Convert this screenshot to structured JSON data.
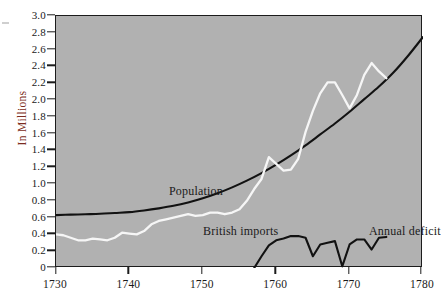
{
  "chart_data": {
    "type": "line",
    "title": "",
    "xlabel": "",
    "ylabel": "In Millions",
    "xlim": [
      1730,
      1780
    ],
    "ylim": [
      0,
      3.0
    ],
    "grid": false,
    "legend_position": "inline-annotations",
    "x_ticks": [
      1730,
      1740,
      1750,
      1760,
      1770,
      1780
    ],
    "x_tick_labels": [
      "1730",
      "1740",
      "1750",
      "1760",
      "1770",
      "1780"
    ],
    "y_ticks": [
      0,
      0.2,
      0.4,
      0.6,
      0.8,
      1.0,
      1.2,
      1.4,
      1.6,
      1.8,
      2.0,
      2.2,
      2.4,
      2.6,
      2.8,
      3.0
    ],
    "y_tick_labels": [
      "0",
      "0.2",
      "0.4",
      "0.6",
      "0.8",
      "1.0",
      "1.2",
      "1.4",
      "1.6",
      "1.8",
      "2.0",
      "2.2",
      "2.4",
      "2.6",
      "2.8",
      "3.0"
    ],
    "series": [
      {
        "name": "Population",
        "color": "#121212",
        "style": "smooth-solid",
        "annotation": "Population",
        "x": [
          1730,
          1732,
          1734,
          1736,
          1738,
          1740,
          1742,
          1744,
          1746,
          1748,
          1750,
          1752,
          1754,
          1756,
          1758,
          1760,
          1762,
          1764,
          1766,
          1768,
          1770,
          1772,
          1774,
          1776,
          1778,
          1780
        ],
        "values": [
          0.63,
          0.635,
          0.64,
          0.645,
          0.655,
          0.665,
          0.685,
          0.71,
          0.74,
          0.78,
          0.83,
          0.89,
          0.96,
          1.04,
          1.13,
          1.23,
          1.34,
          1.46,
          1.59,
          1.72,
          1.86,
          2.01,
          2.16,
          2.33,
          2.53,
          2.75
        ]
      },
      {
        "name": "British imports",
        "color": "#f6f6f6",
        "style": "jagged-solid",
        "annotation": "British imports",
        "x": [
          1730,
          1731,
          1732,
          1733,
          1734,
          1735,
          1736,
          1737,
          1738,
          1739,
          1740,
          1741,
          1742,
          1743,
          1744,
          1745,
          1746,
          1747,
          1748,
          1749,
          1750,
          1751,
          1752,
          1753,
          1754,
          1755,
          1756,
          1757,
          1758,
          1759,
          1760,
          1761,
          1762,
          1763,
          1764,
          1765,
          1766,
          1767,
          1768,
          1769,
          1770,
          1771,
          1772,
          1773,
          1774,
          1775
        ],
        "values": [
          0.4,
          0.39,
          0.36,
          0.33,
          0.33,
          0.35,
          0.34,
          0.33,
          0.36,
          0.42,
          0.41,
          0.4,
          0.44,
          0.52,
          0.56,
          0.58,
          0.6,
          0.62,
          0.64,
          0.62,
          0.63,
          0.66,
          0.66,
          0.64,
          0.66,
          0.7,
          0.8,
          0.94,
          1.06,
          1.32,
          1.24,
          1.16,
          1.17,
          1.3,
          1.62,
          1.87,
          2.08,
          2.21,
          2.21,
          2.06,
          1.9,
          2.06,
          2.3,
          2.44,
          2.34,
          2.26
        ]
      },
      {
        "name": "Annual deficit",
        "color": "#121212",
        "style": "jagged-solid",
        "annotation": "Annual deficit",
        "x": [
          1757,
          1758,
          1759,
          1760,
          1761,
          1762,
          1763,
          1764,
          1765,
          1766,
          1767,
          1768,
          1769,
          1770,
          1771,
          1772,
          1773,
          1774,
          1775
        ],
        "values": [
          0.0,
          0.14,
          0.27,
          0.33,
          0.35,
          0.38,
          0.38,
          0.36,
          0.14,
          0.28,
          0.3,
          0.32,
          0.02,
          0.28,
          0.34,
          0.34,
          0.22,
          0.36,
          0.37
        ]
      }
    ]
  },
  "axes": {
    "y_title": "In Millions",
    "y_title_color": "#7b2b20"
  },
  "annotations": {
    "population": "Population",
    "british_imports": "British imports",
    "annual_deficit": "Annual deficit"
  }
}
